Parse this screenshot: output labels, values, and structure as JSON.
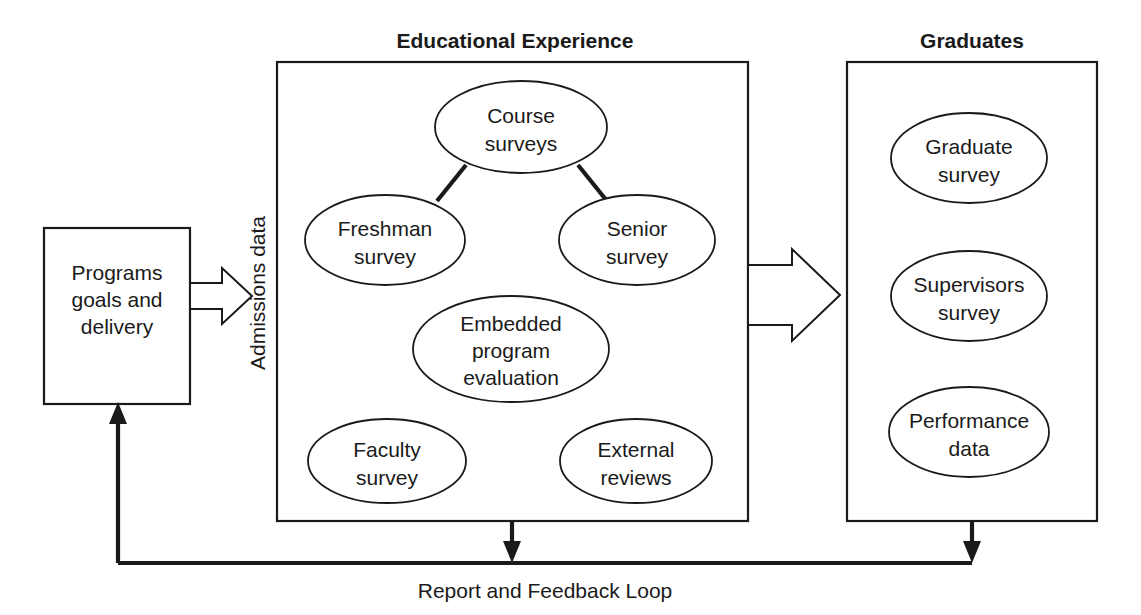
{
  "diagram": {
    "title_left": "Educational Experience",
    "title_right": "Graduates",
    "source": {
      "label_line1": "Programs",
      "label_line2": "goals and",
      "label_line3": "delivery"
    },
    "flow_labels": {
      "admissions": "Admissions data",
      "feedback": "Report and Feedback Loop"
    },
    "educational_nodes": [
      {
        "id": "course-surveys",
        "line1": "Course",
        "line2": "surveys"
      },
      {
        "id": "freshman-survey",
        "line1": "Freshman",
        "line2": "survey"
      },
      {
        "id": "senior-survey",
        "line1": "Senior",
        "line2": "survey"
      },
      {
        "id": "embedded-program-evaluation",
        "line1": "Embedded",
        "line2": "program",
        "line3": "evaluation"
      },
      {
        "id": "faculty-survey",
        "line1": "Faculty",
        "line2": "survey"
      },
      {
        "id": "external-reviews",
        "line1": "External",
        "line2": "reviews"
      }
    ],
    "graduate_nodes": [
      {
        "id": "graduate-survey",
        "line1": "Graduate",
        "line2": "survey"
      },
      {
        "id": "supervisors-survey",
        "line1": "Supervisors",
        "line2": "survey"
      },
      {
        "id": "performance-data",
        "line1": "Performance",
        "line2": "data"
      }
    ],
    "colors": {
      "stroke": "#1a1a1a",
      "fill": "#ffffff",
      "text": "#1a1a1a"
    }
  }
}
